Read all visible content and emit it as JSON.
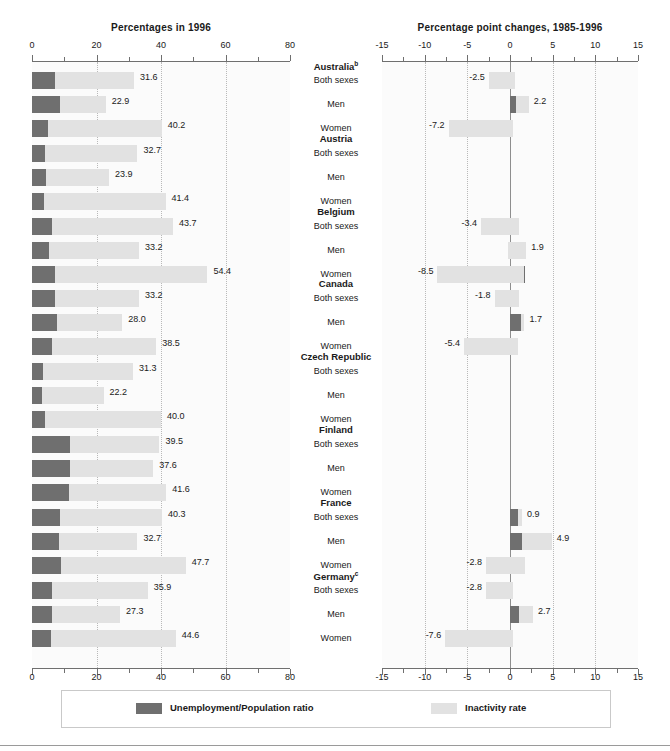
{
  "left_panel": {
    "title": "Percentages in 1996",
    "axis": {
      "min": 0,
      "max": 80,
      "ticks": [
        0,
        20,
        40,
        60,
        80
      ],
      "tick_labels": [
        "0",
        "20",
        "40",
        "60",
        "80"
      ],
      "minor_ticks": [
        10,
        30,
        50,
        70
      ],
      "gridlines": [
        20,
        40,
        60
      ]
    }
  },
  "right_panel": {
    "title": "Percentage point changes, 1985-1996",
    "axis": {
      "min": -15,
      "max": 15,
      "ticks": [
        -15,
        -10,
        -5,
        0,
        5,
        10,
        15
      ],
      "tick_labels": [
        "-15",
        "-10",
        "-5",
        "0",
        "5",
        "10",
        "15"
      ],
      "minor_ticks": [
        -12.5,
        -7.5,
        -2.5,
        2.5,
        7.5,
        12.5
      ],
      "gridlines": [
        -10,
        -5,
        5,
        10
      ]
    }
  },
  "legend": {
    "series_1_label": "Unemployment/Population ratio",
    "series_1_color": "#6f6f6f",
    "series_2_label": "Inactivity rate",
    "series_2_color": "#e2e2e2"
  },
  "categories": [
    "Both sexes",
    "Men",
    "Women"
  ],
  "chart_data": {
    "type": "bar",
    "orientation": "horizontal",
    "stacked": true,
    "series_names": [
      "Unemployment/Population ratio",
      "Inactivity rate"
    ],
    "groups": [
      {
        "country": "Australia",
        "footnote": "b",
        "rows": [
          {
            "category": "Both sexes",
            "level_total": 31.6,
            "level_label": "31.6",
            "level_unemp": 7.2,
            "level_inact": 24.4,
            "change_total": -2.5,
            "change_label": "-2.5",
            "change_unemp": 0.6,
            "change_inact": -3.1
          },
          {
            "category": "Men",
            "level_total": 22.9,
            "level_label": "22.9",
            "level_unemp": 8.7,
            "level_inact": 14.2,
            "change_total": 2.2,
            "change_label": "2.2",
            "change_unemp": 0.7,
            "change_inact": 1.5
          },
          {
            "category": "Women",
            "level_total": 40.2,
            "level_label": "40.2",
            "level_unemp": 5.0,
            "level_inact": 35.2,
            "change_total": -7.2,
            "change_label": "-7.2",
            "change_unemp": 0.4,
            "change_inact": -7.6
          }
        ]
      },
      {
        "country": "Austria",
        "footnote": "",
        "rows": [
          {
            "category": "Both sexes",
            "level_total": 32.7,
            "level_label": "32.7",
            "level_unemp": 4.1,
            "level_inact": 28.6,
            "change_total": null,
            "change_label": "",
            "change_unemp": 0,
            "change_inact": 0
          },
          {
            "category": "Men",
            "level_total": 23.9,
            "level_label": "23.9",
            "level_unemp": 4.4,
            "level_inact": 19.5,
            "change_total": null,
            "change_label": "",
            "change_unemp": 0,
            "change_inact": 0
          },
          {
            "category": "Women",
            "level_total": 41.4,
            "level_label": "41.4",
            "level_unemp": 3.7,
            "level_inact": 37.7,
            "change_total": null,
            "change_label": "",
            "change_unemp": 0,
            "change_inact": 0
          }
        ]
      },
      {
        "country": "Belgium",
        "footnote": "",
        "rows": [
          {
            "category": "Both sexes",
            "level_total": 43.7,
            "level_label": "43.7",
            "level_unemp": 6.2,
            "level_inact": 37.5,
            "change_total": -3.4,
            "change_label": "-3.4",
            "change_unemp": 1.0,
            "change_inact": -4.4
          },
          {
            "category": "Men",
            "level_total": 33.2,
            "level_label": "33.2",
            "level_unemp": 5.3,
            "level_inact": 27.9,
            "change_total": 1.9,
            "change_label": "1.9",
            "change_unemp": -0.2,
            "change_inact": 2.1
          },
          {
            "category": "Women",
            "level_total": 54.4,
            "level_label": "54.4",
            "level_unemp": 7.2,
            "level_inact": 47.2,
            "change_total": -8.5,
            "change_label": "-8.5",
            "change_unemp": 1.7,
            "change_inact": -10.2
          }
        ]
      },
      {
        "country": "Canada",
        "footnote": "",
        "rows": [
          {
            "category": "Both sexes",
            "level_total": 33.2,
            "level_label": "33.2",
            "level_unemp": 7.0,
            "level_inact": 26.2,
            "change_total": -1.8,
            "change_label": "-1.8",
            "change_unemp": 1.1,
            "change_inact": -2.9
          },
          {
            "category": "Men",
            "level_total": 28.0,
            "level_label": "28.0",
            "level_unemp": 7.8,
            "level_inact": 20.2,
            "change_total": 1.7,
            "change_label": "1.7",
            "change_unemp": 1.3,
            "change_inact": 0.4
          },
          {
            "category": "Women",
            "level_total": 38.5,
            "level_label": "38.5",
            "level_unemp": 6.2,
            "level_inact": 32.3,
            "change_total": -5.4,
            "change_label": "-5.4",
            "change_unemp": 0.9,
            "change_inact": -6.3
          }
        ]
      },
      {
        "country": "Czech Republic",
        "footnote": "",
        "rows": [
          {
            "category": "Both sexes",
            "level_total": 31.3,
            "level_label": "31.3",
            "level_unemp": 3.5,
            "level_inact": 27.8,
            "change_total": null,
            "change_label": "",
            "change_unemp": 0,
            "change_inact": 0
          },
          {
            "category": "Men",
            "level_total": 22.2,
            "level_label": "22.2",
            "level_unemp": 3.1,
            "level_inact": 19.1,
            "change_total": null,
            "change_label": "",
            "change_unemp": 0,
            "change_inact": 0
          },
          {
            "category": "Women",
            "level_total": 40.0,
            "level_label": "40.0",
            "level_unemp": 3.9,
            "level_inact": 36.1,
            "change_total": null,
            "change_label": "",
            "change_unemp": 0,
            "change_inact": 0
          }
        ]
      },
      {
        "country": "Finland",
        "footnote": "",
        "rows": [
          {
            "category": "Both sexes",
            "level_total": 39.5,
            "level_label": "39.5",
            "level_unemp": 11.8,
            "level_inact": 27.7,
            "change_total": null,
            "change_label": "",
            "change_unemp": 0,
            "change_inact": 0
          },
          {
            "category": "Men",
            "level_total": 37.6,
            "level_label": "37.6",
            "level_unemp": 11.8,
            "level_inact": 25.8,
            "change_total": null,
            "change_label": "",
            "change_unemp": 0,
            "change_inact": 0
          },
          {
            "category": "Women",
            "level_total": 41.6,
            "level_label": "41.6",
            "level_unemp": 11.5,
            "level_inact": 30.1,
            "change_total": null,
            "change_label": "",
            "change_unemp": 0,
            "change_inact": 0
          }
        ]
      },
      {
        "country": "France",
        "footnote": "",
        "rows": [
          {
            "category": "Both sexes",
            "level_total": 40.3,
            "level_label": "40.3",
            "level_unemp": 8.7,
            "level_inact": 31.6,
            "change_total": 0.9,
            "change_label": "0.9",
            "change_unemp": 1.4,
            "change_inact": -0.5
          },
          {
            "category": "Men",
            "level_total": 32.7,
            "level_label": "32.7",
            "level_unemp": 8.4,
            "level_inact": 24.3,
            "change_total": 4.9,
            "change_label": "4.9",
            "change_unemp": 1.4,
            "change_inact": 3.5
          },
          {
            "category": "Women",
            "level_total": 47.7,
            "level_label": "47.7",
            "level_unemp": 9.0,
            "level_inact": 38.7,
            "change_total": -2.8,
            "change_label": "-2.8",
            "change_unemp": 1.8,
            "change_inact": -4.6
          }
        ]
      },
      {
        "country": "Germany",
        "footnote": "c",
        "rows": [
          {
            "category": "Both sexes",
            "level_total": 35.9,
            "level_label": "35.9",
            "level_unemp": 6.2,
            "level_inact": 29.7,
            "change_total": -2.8,
            "change_label": "-2.8",
            "change_unemp": 0.3,
            "change_inact": -3.1
          },
          {
            "category": "Men",
            "level_total": 27.3,
            "level_label": "27.3",
            "level_unemp": 6.3,
            "level_inact": 21.0,
            "change_total": 2.7,
            "change_label": "2.7",
            "change_unemp": 1.0,
            "change_inact": 1.7
          },
          {
            "category": "Women",
            "level_total": 44.6,
            "level_label": "44.6",
            "level_unemp": 6.0,
            "level_inact": 38.6,
            "change_total": -7.6,
            "change_label": "-7.6",
            "change_unemp": 0.3,
            "change_inact": -7.9
          }
        ]
      }
    ]
  }
}
